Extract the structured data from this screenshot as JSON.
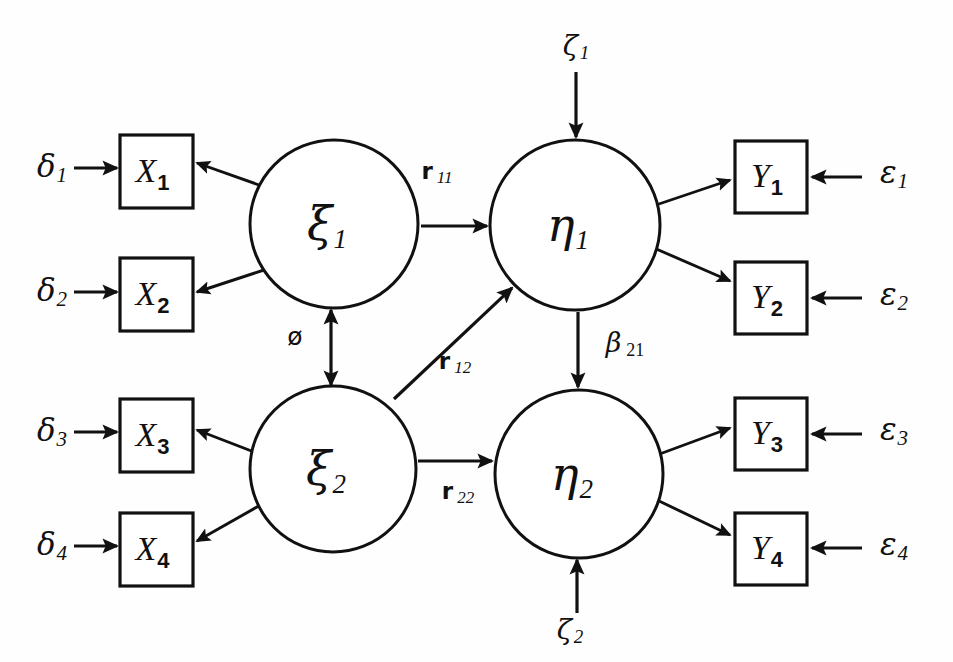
{
  "diagram": {
    "type": "path-diagram",
    "background_color": "#fefefe",
    "stroke_color": "#111111",
    "width": 953,
    "height": 662
  },
  "observed_x": [
    {
      "id": "x1",
      "label": "X",
      "sub": "1",
      "x": 120,
      "y": 135,
      "w": 73,
      "h": 73
    },
    {
      "id": "x2",
      "label": "X",
      "sub": "2",
      "x": 120,
      "y": 258,
      "w": 73,
      "h": 73
    },
    {
      "id": "x3",
      "label": "X",
      "sub": "3",
      "x": 120,
      "y": 399,
      "w": 73,
      "h": 73
    },
    {
      "id": "x4",
      "label": "X",
      "sub": "4",
      "x": 120,
      "y": 513,
      "w": 73,
      "h": 73
    }
  ],
  "observed_y": [
    {
      "id": "y1",
      "label": "Y",
      "sub": "1",
      "x": 735,
      "y": 141,
      "w": 72,
      "h": 72
    },
    {
      "id": "y2",
      "label": "Y",
      "sub": "2",
      "x": 735,
      "y": 262,
      "w": 72,
      "h": 72
    },
    {
      "id": "y3",
      "label": "Y",
      "sub": "3",
      "x": 735,
      "y": 398,
      "w": 72,
      "h": 72
    },
    {
      "id": "y4",
      "label": "Y",
      "sub": "4",
      "x": 735,
      "y": 513,
      "w": 72,
      "h": 72
    }
  ],
  "latents": [
    {
      "id": "xi1",
      "label": "ξ",
      "sub": "1",
      "cx": 334,
      "cy": 224,
      "r": 84
    },
    {
      "id": "xi2",
      "label": "ξ",
      "sub": "2",
      "cx": 333,
      "cy": 469,
      "r": 83
    },
    {
      "id": "eta1",
      "label": "η",
      "sub": "1",
      "cx": 575,
      "cy": 225,
      "r": 85
    },
    {
      "id": "eta2",
      "label": "η",
      "sub": "2",
      "cx": 579,
      "cy": 474,
      "r": 84
    }
  ],
  "delta_errors": [
    {
      "id": "d1",
      "label": "δ",
      "sub": "1",
      "x": 52,
      "y": 168
    },
    {
      "id": "d2",
      "label": "δ",
      "sub": "2",
      "x": 52,
      "y": 292
    },
    {
      "id": "d3",
      "label": "δ",
      "sub": "3",
      "x": 52,
      "y": 432
    },
    {
      "id": "d4",
      "label": "δ",
      "sub": "4",
      "x": 52,
      "y": 546
    }
  ],
  "epsilon_errors": [
    {
      "id": "e1",
      "label": "ε",
      "sub": "1",
      "x": 894,
      "y": 174
    },
    {
      "id": "e2",
      "label": "ε",
      "sub": "2",
      "x": 894,
      "y": 296
    },
    {
      "id": "e3",
      "label": "ε",
      "sub": "3",
      "x": 894,
      "y": 431
    },
    {
      "id": "e4",
      "label": "ε",
      "sub": "4",
      "x": 894,
      "y": 546
    }
  ],
  "disturbances": [
    {
      "id": "z1",
      "label": "ζ",
      "sub": "1",
      "x": 576,
      "y": 47
    },
    {
      "id": "z2",
      "label": "ζ",
      "sub": "2",
      "x": 570,
      "y": 631
    }
  ],
  "path_labels": [
    {
      "id": "r11",
      "label": "r",
      "sub": "11",
      "x": 437,
      "y": 172,
      "style": "path"
    },
    {
      "id": "r12",
      "label": "r",
      "sub": "12",
      "x": 455,
      "y": 362,
      "style": "path"
    },
    {
      "id": "r22",
      "label": "r",
      "sub": "22",
      "x": 458,
      "y": 492,
      "style": "path"
    },
    {
      "id": "beta21",
      "label": "β",
      "sub": "21",
      "x": 625,
      "y": 344,
      "style": "beta"
    },
    {
      "id": "phi",
      "label": "ø",
      "sub": "",
      "x": 295,
      "y": 338,
      "style": "phi"
    }
  ],
  "arrows": {
    "delta_to_x": [
      {
        "id": "a-d1-x1",
        "x1": 74,
        "y1": 168,
        "x2": 117,
        "y2": 168
      },
      {
        "id": "a-d2-x2",
        "x1": 74,
        "y1": 292,
        "x2": 117,
        "y2": 292
      },
      {
        "id": "a-d3-x3",
        "x1": 74,
        "y1": 432,
        "x2": 117,
        "y2": 432
      },
      {
        "id": "a-d4-x4",
        "x1": 74,
        "y1": 546,
        "x2": 117,
        "y2": 546
      }
    ],
    "xi_to_x": [
      {
        "id": "a-xi1-x1",
        "x1": 262,
        "y1": 186,
        "x2": 197,
        "y2": 163
      },
      {
        "id": "a-xi1-x2",
        "x1": 264,
        "y1": 270,
        "x2": 197,
        "y2": 292
      },
      {
        "id": "a-xi2-x3",
        "x1": 262,
        "y1": 455,
        "x2": 197,
        "y2": 430
      },
      {
        "id": "a-xi2-x4",
        "x1": 264,
        "y1": 503,
        "x2": 197,
        "y2": 541
      }
    ],
    "eta_to_y": [
      {
        "id": "a-eta1-y1",
        "x1": 653,
        "y1": 206,
        "x2": 730,
        "y2": 180
      },
      {
        "id": "a-eta1-y2",
        "x1": 654,
        "y1": 248,
        "x2": 730,
        "y2": 281
      },
      {
        "id": "a-eta2-y3",
        "x1": 657,
        "y1": 455,
        "x2": 730,
        "y2": 428
      },
      {
        "id": "a-eta2-y4",
        "x1": 657,
        "y1": 500,
        "x2": 730,
        "y2": 535
      }
    ],
    "epsilon_to_y": [
      {
        "id": "a-e1-y1",
        "x1": 862,
        "y1": 177,
        "x2": 812,
        "y2": 177
      },
      {
        "id": "a-e2-y2",
        "x1": 862,
        "y1": 298,
        "x2": 812,
        "y2": 298
      },
      {
        "id": "a-e3-y3",
        "x1": 862,
        "y1": 434,
        "x2": 812,
        "y2": 434
      },
      {
        "id": "a-e4-y4",
        "x1": 862,
        "y1": 548,
        "x2": 812,
        "y2": 548
      }
    ],
    "structural": [
      {
        "id": "a-r11",
        "x1": 421,
        "y1": 226,
        "x2": 487,
        "y2": 226
      },
      {
        "id": "a-r12",
        "x1": 394,
        "y1": 399,
        "x2": 512,
        "y2": 288
      },
      {
        "id": "a-r22",
        "x1": 418,
        "y1": 461,
        "x2": 492,
        "y2": 461
      },
      {
        "id": "a-beta21",
        "x1": 578,
        "y1": 312,
        "x2": 578,
        "y2": 387
      }
    ],
    "disturbance": [
      {
        "id": "a-z1-eta1",
        "x1": 576,
        "y1": 72,
        "x2": 576,
        "y2": 137
      },
      {
        "id": "a-z2-eta2",
        "x1": 577,
        "y1": 613,
        "x2": 577,
        "y2": 560
      }
    ],
    "covariance": {
      "id": "a-phi",
      "x1": 331,
      "y1": 310,
      "x2": 331,
      "y2": 385
    }
  }
}
